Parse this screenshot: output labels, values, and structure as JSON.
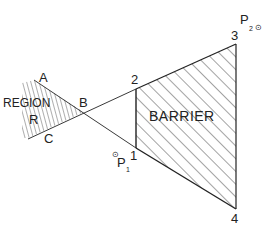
{
  "diagram": {
    "labels": {
      "region": "REGION",
      "barrier": "BARRIER",
      "a": "A",
      "b": "B",
      "c": "C",
      "r": "R",
      "v1": "1",
      "v2": "2",
      "v3": "3",
      "v4": "4",
      "p1": "P",
      "p1_sub": "1",
      "p2": "P",
      "p2_sub": "2",
      "point_marker": "⊙"
    },
    "colors": {
      "line": "#222222",
      "hatch": "#333333",
      "background": "#ffffff"
    }
  }
}
